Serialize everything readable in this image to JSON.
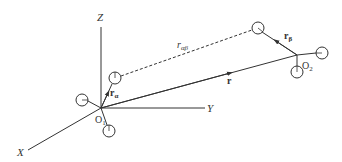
{
  "diagram": {
    "colors": {
      "line": "#333333",
      "background": "#ffffff"
    },
    "axes": {
      "z_label": "Z",
      "y_label": "Y",
      "x_label": "X"
    },
    "origins": {
      "o1_label": "O",
      "o1_sub": "1",
      "o2_label": "O",
      "o2_sub": "2"
    },
    "vectors": {
      "r_label": "r",
      "r_alpha_label": "r",
      "r_alpha_sub": "α",
      "r_beta_label": "r",
      "r_beta_sub": "β",
      "r_alphabeta_label": "r",
      "r_alphabeta_sub": "αβ"
    }
  }
}
